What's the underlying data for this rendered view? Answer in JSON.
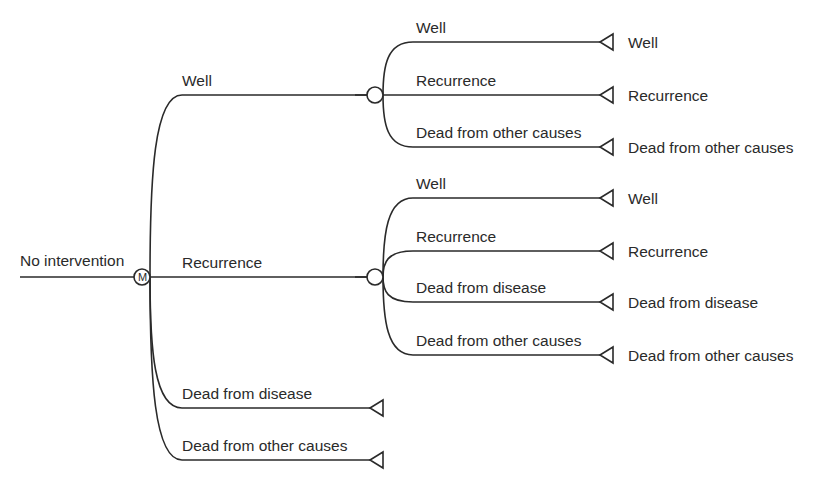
{
  "diagram": {
    "type": "decision-tree-markov",
    "root": {
      "label": "No intervention",
      "line": {
        "x1": 20,
        "x2": 134,
        "y": 277
      }
    },
    "markov_node": {
      "symbol": "M",
      "cx": 142,
      "cy": 277,
      "r": 8,
      "branch_x": 150,
      "branch_end_x": 375,
      "states": [
        {
          "label": "Well",
          "y": 95,
          "label_x": 182,
          "child": {
            "type": "chance",
            "cx": 375,
            "cy": 95,
            "r": 8,
            "branch_x": 383,
            "branches": [
              {
                "label": "Well",
                "y": 42,
                "terminal_label": "Well"
              },
              {
                "label": "Recurrence",
                "y": 95,
                "terminal_label": "Recurrence"
              },
              {
                "label": "Dead from other causes",
                "y": 147,
                "terminal_label": "Dead from other causes"
              }
            ]
          }
        },
        {
          "label": "Recurrence",
          "y": 277,
          "label_x": 182,
          "child": {
            "type": "chance",
            "cx": 375,
            "cy": 277,
            "r": 8,
            "branch_x": 383,
            "branches": [
              {
                "label": "Well",
                "y": 198,
                "terminal_label": "Well"
              },
              {
                "label": "Recurrence",
                "y": 251,
                "terminal_label": "Recurrence"
              },
              {
                "label": "Dead from disease",
                "y": 302,
                "terminal_label": "Dead from disease"
              },
              {
                "label": "Dead from other causes",
                "y": 355,
                "terminal_label": "Dead from other causes"
              }
            ]
          }
        },
        {
          "label": "Dead from disease",
          "y": 408,
          "label_x": 182,
          "terminal_x": 370,
          "child": {
            "type": "terminal"
          }
        },
        {
          "label": "Dead from other causes",
          "y": 460,
          "label_x": 182,
          "terminal_x": 370,
          "child": {
            "type": "terminal"
          }
        }
      ]
    },
    "terminal": {
      "tip_x": 600,
      "base_x": 613,
      "half_h": 8,
      "label_x": 628
    },
    "colors": {
      "stroke": "#2a2a2a",
      "background": "#ffffff",
      "text": "#2a2a2a"
    }
  }
}
